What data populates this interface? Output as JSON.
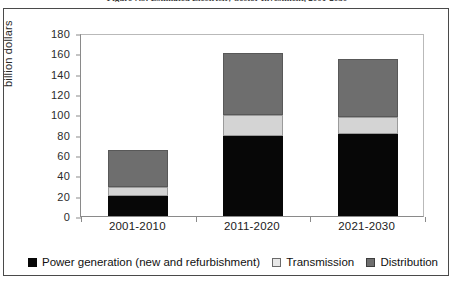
{
  "figure": {
    "caption_prefix": "Figure 7.5:",
    "caption_text": "Estimated Electricity Sector Investment, 2001-2030",
    "caption_full": "Figure 7.5: Estimated Electricity Sector Investment, 2001-2030"
  },
  "chart_data": {
    "type": "bar",
    "subtype": "stacked-column",
    "title": "Estimated Electricity Sector Investment, 2001-2030",
    "xlabel": "",
    "ylabel": "billion dollars",
    "categories": [
      "2001-2010",
      "2011-2020",
      "2021-2030"
    ],
    "series": [
      {
        "name": "Power generation (new and refurbishment)",
        "color": "#070707",
        "values": [
          20,
          79,
          81
        ]
      },
      {
        "name": "Transmission",
        "color": "#d4d4d4",
        "values": [
          9,
          20,
          16
        ]
      },
      {
        "name": "Distribution",
        "color": "#6e6e6e",
        "values": [
          36,
          61,
          57
        ]
      }
    ],
    "totals": [
      65,
      160,
      154
    ],
    "ylim": [
      0,
      180
    ],
    "ytick_step": 20,
    "yticks": [
      180,
      160,
      140,
      120,
      100,
      80,
      60,
      40,
      20,
      0
    ],
    "grid": false,
    "legend_position": "bottom"
  },
  "legend": {
    "items": [
      {
        "label": "Power generation (new and refurbishment)",
        "swatch": "black"
      },
      {
        "label": "Transmission",
        "swatch": "light-gray"
      },
      {
        "label": "Distribution",
        "swatch": "dark-gray"
      }
    ]
  },
  "colors": {
    "power_generation": "#070707",
    "transmission": "#d4d4d4",
    "distribution": "#6e6e6e",
    "axis": "#8a8a8a",
    "frame": "#4a4a4a",
    "text": "#1a1a1a"
  }
}
